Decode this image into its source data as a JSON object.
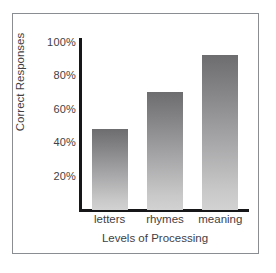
{
  "chart_data": {
    "type": "bar",
    "title": "",
    "subtitle": "",
    "xlabel": "Levels of Processing",
    "ylabel": "Correct Responses",
    "categories": [
      "letters",
      "rhymes",
      "meaning"
    ],
    "values": [
      48,
      70,
      92
    ],
    "value_unit": "%",
    "ylim": [
      0,
      100
    ],
    "yticks": [
      100,
      80,
      60,
      40,
      20
    ],
    "ytick_labels": [
      "100%",
      "80%",
      "60%",
      "40%",
      "20%"
    ],
    "grid": false,
    "legend": null,
    "annotations": [],
    "bar_fill": {
      "style": "vertical-gradient",
      "top_color": "#6d6d6f",
      "bottom_color": "#d2d2d2"
    },
    "axis_color": "#17171a",
    "text_color": "#3f4145",
    "frame_color": "#8a8d92",
    "background": "#ffffff"
  },
  "figure": {
    "border_color": "#8a8d92",
    "background": "#ffffff"
  }
}
